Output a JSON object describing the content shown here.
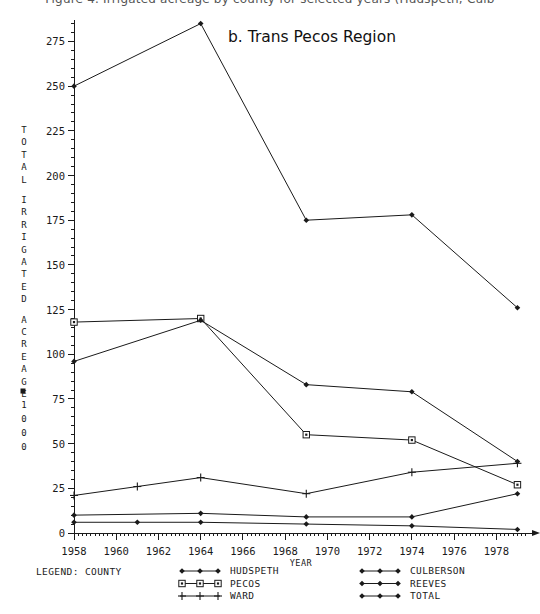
{
  "figure": {
    "cut_off_header": "Figure 4. Irrigated acreage by county for selected years (Hudspeth, Culb",
    "title": "b. Trans Pecos Region",
    "y_axis_title": "TOTAL IRRIGATED ACREAGE",
    "y_axis_units": "× 1000",
    "x_axis_title": "YEAR",
    "legend_heading": "LEGEND: COUNTY"
  },
  "chart_data": {
    "type": "line",
    "title": "b. Trans Pecos Region",
    "xlabel": "YEAR",
    "ylabel": "TOTAL IRRIGATED ACREAGE × 1000",
    "xlim": [
      1958,
      1979.5
    ],
    "ylim": [
      0,
      287
    ],
    "xticks": [
      1958,
      1960,
      1962,
      1964,
      1966,
      1968,
      1970,
      1972,
      1974,
      1976,
      1978
    ],
    "xtick_labels": [
      "1958",
      "1960",
      "1962",
      "1964",
      "1966",
      "1968",
      "1970",
      "1972",
      "1974",
      "1976",
      "1978"
    ],
    "yticks": [
      0,
      25,
      50,
      75,
      100,
      125,
      150,
      175,
      200,
      225,
      250,
      275
    ],
    "ytick_labels": [
      "0",
      "25",
      "50",
      "75",
      "100",
      "125",
      "150",
      "175",
      "200",
      "225",
      "250",
      "275"
    ],
    "grid": false,
    "legend_position": "below-axes",
    "series": [
      {
        "name": "HUDSPETH",
        "marker": "diamond",
        "x": [
          1958,
          1961,
          1964,
          1969,
          1974,
          1979
        ],
        "values": [
          6,
          6,
          6,
          5,
          4,
          2
        ]
      },
      {
        "name": "PECOS",
        "marker": "square",
        "x": [
          1958,
          1964,
          1969,
          1974,
          1979
        ],
        "values": [
          118,
          120,
          55,
          52,
          27
        ]
      },
      {
        "name": "WARD",
        "marker": "plus",
        "x": [
          1958,
          1961,
          1964,
          1969,
          1974,
          1979
        ],
        "values": [
          21,
          26,
          31,
          22,
          34,
          39
        ]
      },
      {
        "name": "CULBERSON",
        "marker": "diamond",
        "x": [
          1958,
          1964,
          1969,
          1974,
          1979
        ],
        "values": [
          10,
          11,
          9,
          9,
          22
        ]
      },
      {
        "name": "REEVES",
        "marker": "diamond",
        "x": [
          1958,
          1964,
          1969,
          1974,
          1979
        ],
        "values": [
          96,
          119,
          83,
          79,
          40
        ]
      },
      {
        "name": "TOTAL",
        "marker": "diamond",
        "x": [
          1958,
          1964,
          1969,
          1974,
          1979
        ],
        "values": [
          250,
          285,
          175,
          178,
          126
        ]
      }
    ]
  },
  "legend": {
    "heading": "LEGEND: COUNTY",
    "columns": [
      {
        "entries": [
          {
            "label": "HUDSPETH",
            "marker": "diamond"
          },
          {
            "label": "PECOS",
            "marker": "square"
          },
          {
            "label": "WARD",
            "marker": "plus"
          }
        ]
      },
      {
        "entries": [
          {
            "label": "CULBERSON",
            "marker": "diamond"
          },
          {
            "label": "REEVES",
            "marker": "diamond"
          },
          {
            "label": "TOTAL",
            "marker": "diamond"
          }
        ]
      }
    ]
  },
  "colors": {
    "ink": "#1a1a1a",
    "background": "#ffffff"
  }
}
